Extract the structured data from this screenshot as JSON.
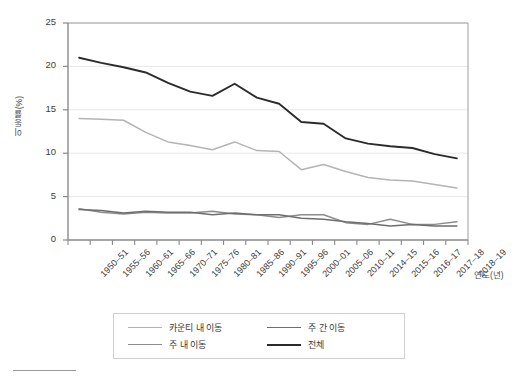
{
  "chart_data": {
    "type": "line",
    "title": "",
    "xlabel": "연도(년)",
    "ylabel": "이동률(%)",
    "ylim": [
      0,
      25
    ],
    "yticks": [
      0,
      5,
      10,
      15,
      20,
      25
    ],
    "grid": true,
    "legend_position": "bottom",
    "categories": [
      "1950-51",
      "1955-56",
      "1960-61",
      "1965-66",
      "1970-71",
      "1975-76",
      "1980-81",
      "1985-86",
      "1990-91",
      "1995-96",
      "2000-01",
      "2005-06",
      "2010-11",
      "2014-15",
      "2015-16",
      "2016-17",
      "2017-18",
      "2018-19"
    ],
    "series": [
      {
        "name": "카운티 내 이동",
        "color": "#b4b4b4",
        "values": [
          14.0,
          13.9,
          13.8,
          12.4,
          11.3,
          10.9,
          10.4,
          11.3,
          10.3,
          10.2,
          8.1,
          8.7,
          7.9,
          7.2,
          6.9,
          6.8,
          6.4,
          6.0
        ]
      },
      {
        "name": "주 내 이동",
        "color": "#8c8c8c",
        "values": [
          3.6,
          3.2,
          3.0,
          3.2,
          3.1,
          3.1,
          3.3,
          3.0,
          2.9,
          2.6,
          2.9,
          2.9,
          2.0,
          1.8,
          2.4,
          1.8,
          1.8,
          2.1
        ]
      },
      {
        "name": "주 간 이동",
        "color": "#6e6e6e",
        "values": [
          3.5,
          3.4,
          3.1,
          3.3,
          3.2,
          3.2,
          2.9,
          3.1,
          2.9,
          2.9,
          2.5,
          2.4,
          2.1,
          1.9,
          1.6,
          1.8,
          1.6,
          1.6
        ]
      },
      {
        "name": "전체",
        "color": "#2b2b2b",
        "values": [
          21.0,
          20.4,
          19.9,
          19.3,
          18.1,
          17.1,
          16.6,
          18.0,
          16.4,
          15.7,
          13.6,
          13.4,
          11.7,
          11.1,
          10.8,
          10.6,
          9.9,
          9.4
        ]
      }
    ]
  },
  "legend": {
    "entries": [
      {
        "label": "카운티 내 이동"
      },
      {
        "label": "주 간 이동"
      },
      {
        "label": "주 내 이동"
      },
      {
        "label": "전체"
      }
    ]
  }
}
